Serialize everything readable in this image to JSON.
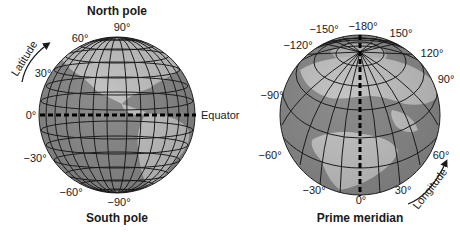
{
  "left_globe": {
    "title_top": "North pole",
    "title_bottom": "South pole",
    "arrow_label": "Latitude",
    "equator_label": "Equator",
    "latitude_labels": {
      "north_90": "90°",
      "north_60": "60°",
      "north_30": "30°",
      "zero": "0°",
      "south_30": "−30°",
      "south_60": "−60°",
      "south_90": "−90°"
    }
  },
  "right_globe": {
    "title_bottom": "Prime meridian",
    "arrow_label": "Longitude",
    "longitude_labels": {
      "neg180": "−180°",
      "neg150": "−150°",
      "neg120": "−120°",
      "neg90": "−90°",
      "neg60": "−60°",
      "neg30": "−30°",
      "zero": "0°",
      "pos30": "30°",
      "pos60": "60°",
      "pos90": "90°",
      "pos120": "120°",
      "pos150": "150°"
    }
  },
  "colors": {
    "ocean": "#8c8c8c",
    "land": "#c4c4c4",
    "grid": "#1e1e1e",
    "dashed_line": "#000000"
  }
}
